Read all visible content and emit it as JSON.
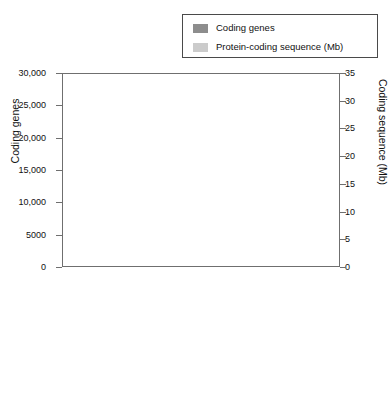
{
  "legend": {
    "entries": [
      {
        "label": "Coding genes",
        "color": "#8d8d8d"
      },
      {
        "label": "Protein-coding sequence (Mb)",
        "color": "#cbcbcb"
      }
    ]
  },
  "axes": {
    "left_title": "Coding genes",
    "right_title": "Coding sequence (Mb)",
    "left_ticks": [
      "0",
      "5000",
      "10,000",
      "15,000",
      "20,000",
      "25,000",
      "30,000"
    ],
    "right_ticks": [
      "0",
      "5",
      "10",
      "15",
      "20",
      "25",
      "30",
      "35"
    ]
  },
  "chart_data": {
    "type": "bar",
    "title": "",
    "xlabel": "",
    "ylabel": "Coding genes",
    "y2label": "Coding sequence (Mb)",
    "ylim": [
      0,
      30000
    ],
    "y2lim": [
      0,
      35
    ],
    "ytick_step": 5000,
    "y2tick_step": 5,
    "grid": false,
    "legend_position": "top-right",
    "categories": [
      "D. discoideum (slime mould)",
      "C. elegans (nematode)",
      "D. melanogaster (fruit fly)",
      "T. nigroviridis (green spotted pufferfish)",
      "G. gallus (red junglefowl)",
      "M. musculus (mouse)",
      "H. sapiens (human)"
    ],
    "category_parts": [
      {
        "scientific": "D. discoideum",
        "common": "(slime mould)"
      },
      {
        "scientific": "C. elegans",
        "common": "(nematode)"
      },
      {
        "scientific": "D. melanogaster",
        "common": "(fruit fly)"
      },
      {
        "scientific": "T. nigroviridis",
        "common": "(green spotted pufferfish)"
      },
      {
        "scientific": "G. gallus",
        "common": "(red junglefowl)"
      },
      {
        "scientific": "M. musculus",
        "common": "(mouse)"
      },
      {
        "scientific": "H. sapiens",
        "common": "(human)"
      }
    ],
    "series": [
      {
        "name": "Coding genes",
        "axis": "left",
        "color": "#8d8d8d",
        "values": [
          16000,
          19800,
          13900,
          28000,
          24700,
          18800,
          19800
        ]
      },
      {
        "name": "Protein-coding sequence (Mb)",
        "axis": "right",
        "color": "#cbcbcb",
        "values": [
          20.8,
          25.0,
          21.6,
          30.3,
          24.6,
          27.2,
          31.6
        ]
      }
    ]
  }
}
